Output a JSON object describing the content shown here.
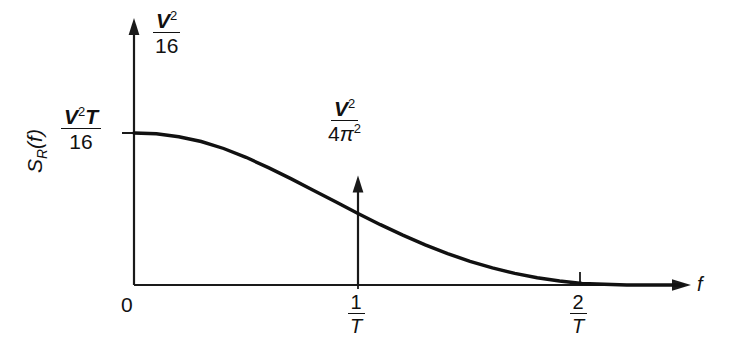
{
  "figure": {
    "kind": "spectral-density-plot",
    "background_color": "#ffffff",
    "ink_color": "#111111"
  },
  "axes": {
    "y_axis": {
      "label_text": "S_R(f)",
      "label_parts": {
        "symbol": "S",
        "subscript": "R",
        "argument": "(f)"
      },
      "top_annotation": {
        "numerator": "V",
        "numerator_exponent": "2",
        "denominator": "16"
      },
      "origin_tick_label": {
        "numerator": "V",
        "numerator_exponent": "2",
        "numerator_suffix": "T",
        "denominator": "16"
      },
      "arrow": "up"
    },
    "x_axis": {
      "label_text": "f",
      "arrow": "right",
      "ticks": [
        {
          "label_numerator": "0",
          "label_denominator": "",
          "value_text": "0"
        },
        {
          "label_numerator": "1",
          "label_denominator": "T",
          "value_text": "1/T"
        },
        {
          "label_numerator": "2",
          "label_denominator": "T",
          "value_text": "2/T"
        }
      ]
    }
  },
  "impulse": {
    "at_tick": "1/T",
    "direction": "up",
    "weight_label": {
      "numerator": "V",
      "numerator_exponent": "2",
      "denominator_coef": "4",
      "denominator_symbol": "π",
      "denominator_exponent": "2"
    }
  },
  "chart_data": {
    "type": "line",
    "title": "",
    "xlabel": "f",
    "ylabel": "S_R(f)",
    "xlim": [
      0,
      2.5
    ],
    "ylim": [
      0,
      1.32
    ],
    "grid": false,
    "legend": null,
    "x_tick_values": [
      0,
      1,
      2
    ],
    "x_tick_labels": [
      "0",
      "1/T",
      "2/T"
    ],
    "y_tick_values": [
      1.0
    ],
    "y_tick_labels": [
      "V²T/16"
    ],
    "y_axis_top_label": "V²/16",
    "annotations": [
      {
        "text": "V²/4π²",
        "type": "impulse-weight",
        "x": 1,
        "y_top": 0.72
      }
    ],
    "series": [
      {
        "name": "S_R(f)",
        "note": "raised-cosine / sinc-squared style roll-off from V²T/16 at f=0 to 0 near f=2/T",
        "x": [
          0.0,
          0.1,
          0.2,
          0.3,
          0.4,
          0.5,
          0.6,
          0.7,
          0.8,
          0.9,
          1.0,
          1.1,
          1.2,
          1.3,
          1.4,
          1.5,
          1.6,
          1.7,
          1.8,
          1.9,
          2.0,
          2.2,
          2.45
        ],
        "y": [
          1.0,
          0.995,
          0.975,
          0.944,
          0.898,
          0.84,
          0.772,
          0.7,
          0.624,
          0.547,
          0.47,
          0.397,
          0.328,
          0.264,
          0.207,
          0.156,
          0.113,
          0.077,
          0.048,
          0.026,
          0.01,
          0.0,
          0.0
        ]
      }
    ],
    "impulses": [
      {
        "x": 1,
        "height": 0.72,
        "label": "V²/4π²"
      }
    ]
  },
  "geometry": {
    "origin_px": [
      134,
      285
    ],
    "x_axis_end_px": 690,
    "y_axis_top_px": 20,
    "tick_1T_px": 358,
    "tick_2T_px": 580,
    "curve_start_y_px": 133,
    "impulse_top_px": 165
  }
}
